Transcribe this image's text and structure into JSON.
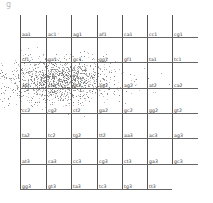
{
  "panel_label": "g",
  "grid": {
    "columns_x": [
      20,
      46,
      71,
      97,
      122,
      147,
      172
    ],
    "rows_y": [
      37,
      62,
      88,
      113,
      138,
      164,
      189
    ],
    "vline_top": 15,
    "hline_right": 198,
    "last_row_right": 172,
    "rows": [
      [
        "aa1",
        "ac1",
        "ag1",
        "af1",
        "ca1",
        "cc1",
        "cg1"
      ],
      [
        "cf1",
        "ga1",
        "gc1",
        "gg1",
        "gf1",
        "ta1",
        "tc1"
      ],
      [
        "at2",
        "ct2",
        "gt2",
        "ag2",
        "ag2",
        "at2",
        "ca2"
      ],
      [
        "cc2",
        "cg2",
        "ct2",
        "ga2",
        "gc2",
        "gg2",
        "gt2"
      ],
      [
        "ta2",
        "tc2",
        "tg2",
        "tt2",
        "aa3",
        "ac3",
        "ag3"
      ],
      [
        "at3",
        "ca3",
        "cc3",
        "cg3",
        "ct3",
        "ga3",
        "gc3"
      ],
      [
        "gg3",
        "gt3",
        "ta3",
        "tc3",
        "tg3",
        "tt3"
      ]
    ]
  },
  "scatter": {
    "center": [
      60,
      80
    ],
    "spread": [
      28,
      11
    ],
    "count": 1400,
    "color": "#666666"
  }
}
